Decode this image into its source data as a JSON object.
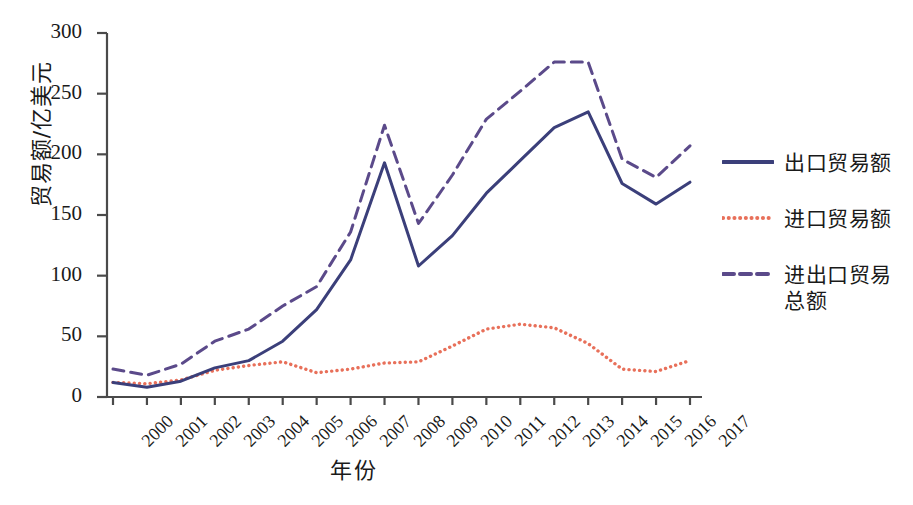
{
  "chart_data": {
    "type": "line",
    "title": "",
    "xlabel": "年份",
    "ylabel": "贸易额/亿美元",
    "categories": [
      "2000",
      "2001",
      "2002",
      "2003",
      "2004",
      "2005",
      "2006",
      "2007",
      "2008",
      "2009",
      "2010",
      "2011",
      "2012",
      "2013",
      "2014",
      "2015",
      "2016",
      "2017"
    ],
    "xlim": [
      0,
      17
    ],
    "ylim": [
      0,
      300
    ],
    "yticks": [
      0,
      50,
      100,
      150,
      200,
      250,
      300
    ],
    "grid": false,
    "legend_position": "right",
    "series": [
      {
        "name": "出口贸易额",
        "style": "solid",
        "color": "#3b3f7a",
        "values": [
          12,
          8,
          13,
          24,
          30,
          46,
          72,
          113,
          193,
          108,
          133,
          168,
          195,
          222,
          235,
          176,
          159,
          177
        ]
      },
      {
        "name": "进口贸易额",
        "style": "dotted",
        "color": "#e8705a",
        "values": [
          12,
          11,
          14,
          22,
          26,
          29,
          20,
          23,
          28,
          29,
          42,
          56,
          60,
          57,
          44,
          23,
          21,
          30
        ]
      },
      {
        "name": "进出口贸易总额",
        "style": "dashed",
        "color": "#5b4a8a",
        "values": [
          23,
          18,
          27,
          46,
          56,
          75,
          91,
          136,
          224,
          143,
          183,
          229,
          252,
          276,
          276,
          196,
          181,
          207
        ]
      }
    ]
  },
  "legend": {
    "items": [
      {
        "label": "出口贸易额"
      },
      {
        "label": "进口贸易额"
      },
      {
        "label": "进出口贸易\n总额"
      }
    ]
  },
  "axes": {
    "y_title": "贸易额/亿美元",
    "x_title": "年份"
  }
}
